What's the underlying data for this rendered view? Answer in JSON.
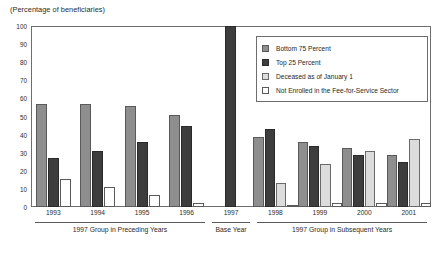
{
  "chart_data": {
    "type": "bar",
    "title": "",
    "subtitle": "",
    "ylabel": "(Percentage of beneficiaries)",
    "xlabel": "",
    "ylim": [
      0,
      100
    ],
    "ytick_step": 10,
    "ytick_labels": [
      "0",
      "10",
      "20",
      "30",
      "40",
      "50",
      "60",
      "70",
      "80",
      "90",
      "100"
    ],
    "grid": false,
    "legend_position": "inside-top-right",
    "categories": [
      "1993",
      "1994",
      "1995",
      "1996",
      "1997",
      "1998",
      "1999",
      "2000",
      "2001"
    ],
    "series": [
      {
        "name": "Bottom 75 Percent",
        "color": "#8e8e8e",
        "values": [
          57,
          56.8,
          55.7,
          51,
          0,
          38.5,
          36,
          32.5,
          29
        ]
      },
      {
        "name": "Top 25 Percent",
        "color": "#3d3d3d",
        "values": [
          27,
          31,
          36,
          44.8,
          100,
          43,
          33.5,
          28.5,
          25
        ]
      },
      {
        "name": "Deceased as of January 1",
        "color": "#dcdcdc",
        "values": [
          0,
          0,
          0,
          0,
          0,
          13.5,
          23.5,
          31,
          37.8
        ]
      },
      {
        "name": "Not Enrolled in the Fee-for-Service Sector",
        "color": "#ffffff",
        "values": [
          15.4,
          11,
          6.8,
          2.2,
          0,
          1.3,
          2,
          2.3,
          2.3
        ]
      }
    ],
    "sections": [
      {
        "label": "1997 Group in Preceding Years",
        "categories": [
          "1993",
          "1994",
          "1995",
          "1996"
        ]
      },
      {
        "label": "Base Year",
        "categories": [
          "1997"
        ]
      },
      {
        "label": "1997 Group in Subsequent Years",
        "categories": [
          "1998",
          "1999",
          "2000",
          "2001"
        ]
      }
    ]
  },
  "legend": {
    "entries": [
      {
        "label": "Bottom 75 Percent",
        "swatch": "medium-gray"
      },
      {
        "label": "Top 25 Percent",
        "swatch": "dark-gray"
      },
      {
        "label": "Deceased as of January 1",
        "swatch": "light-gray"
      },
      {
        "label": "Not Enrolled in the Fee-for-Service Sector",
        "swatch": "white"
      }
    ]
  }
}
